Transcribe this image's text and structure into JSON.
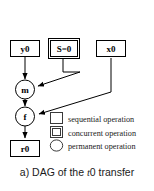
{
  "figure": {
    "caption_prefix": "a) DAG of the ",
    "caption_italic": "t",
    "caption_suffix": "0 transfer"
  },
  "nodes": [
    {
      "id": "y0",
      "label": "y0",
      "shape": "rect",
      "type": "sequential"
    },
    {
      "id": "S0",
      "label": "S=0",
      "shape": "double-rect",
      "type": "concurrent"
    },
    {
      "id": "x0",
      "label": "x0",
      "shape": "rect",
      "type": "sequential"
    },
    {
      "id": "m",
      "label": "m",
      "shape": "circle",
      "type": "permanent"
    },
    {
      "id": "f",
      "label": "f",
      "shape": "circle",
      "type": "permanent"
    },
    {
      "id": "r0",
      "label": "r0",
      "shape": "rect",
      "type": "sequential"
    }
  ],
  "edges": [
    {
      "from": "y0",
      "to": "m"
    },
    {
      "from": "S0",
      "to": "m"
    },
    {
      "from": "x0",
      "to": "f"
    },
    {
      "from": "m",
      "to": "f"
    },
    {
      "from": "f",
      "to": "r0"
    }
  ],
  "legend": {
    "items": [
      {
        "icon": "square-icon",
        "label": "sequential operation"
      },
      {
        "icon": "double-square-icon",
        "label": "concurrent operation"
      },
      {
        "icon": "circle-icon",
        "label": "permanent operation"
      }
    ]
  },
  "colors": {
    "background": "#ffffff",
    "stroke": "#000000",
    "legend_stroke": "#3a3a3a",
    "text": "#1a1a1a"
  }
}
